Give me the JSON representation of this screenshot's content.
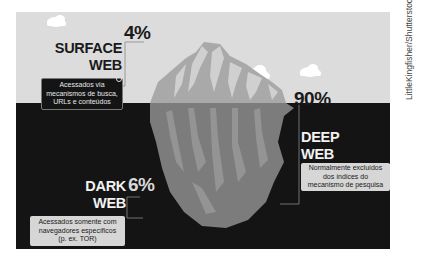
{
  "colors": {
    "sky": "#dcdcdc",
    "water": "#141414",
    "iceberg_above": "#a9a9a9",
    "iceberg_highlight": "#d0d0d0",
    "iceberg_below": "#7c7c7c",
    "iceberg_below_streak": "#9a9a9a",
    "cloud": "#ffffff"
  },
  "surface": {
    "title_line1": "SURFACE",
    "title_line2": "WEB",
    "percent": "4%",
    "description_line1": "Acessados via",
    "description_line2": "mecanismos de busca,",
    "description_line3": "URLs e conteúdos",
    "icon": "magnifier-icon"
  },
  "deep": {
    "title_line1": "DEEP",
    "title_line2": "WEB",
    "percent": "90%",
    "description_line1": "Normalmente excluídos",
    "description_line2": "dos índices do",
    "description_line3": "mecanismo de pesquisa",
    "icon": "pin-icon"
  },
  "dark": {
    "title_line1": "DARK",
    "title_line2": "WEB",
    "percent": "6%",
    "description_line1": "Acessados somente com",
    "description_line2": "navegadores específicos",
    "description_line3": "(p. ex. TOR)"
  },
  "credit": "LittleKingfisher/Shutterstock"
}
